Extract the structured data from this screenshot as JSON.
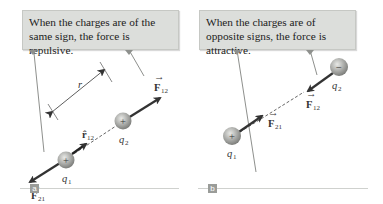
{
  "panels": {
    "a": {
      "tag": "a",
      "caption": "When the charges are of the same sign, the force is repulsive.",
      "charges": {
        "q1": {
          "label": "q",
          "sub": "1",
          "sign": "+"
        },
        "q2": {
          "label": "q",
          "sub": "2",
          "sign": "+"
        }
      },
      "labels": {
        "F12": "F",
        "F12_sub": "12",
        "F21": "F",
        "F21_sub": "21",
        "r12": "r̂",
        "r12_sub": "12",
        "r": "r"
      }
    },
    "b": {
      "tag": "b",
      "caption": "When the charges are of opposite signs, the force is attractive.",
      "charges": {
        "q1": {
          "label": "q",
          "sub": "1",
          "sign": "+"
        },
        "q2": {
          "label": "q",
          "sub": "2",
          "sign": "−"
        }
      },
      "labels": {
        "F12": "F",
        "F12_sub": "12",
        "F21": "F",
        "F21_sub": "21"
      }
    }
  },
  "colors": {
    "callout_bg": "#dcdedb",
    "arrow": "#333333",
    "charge": "#a8a9a6",
    "leader": "#8e908d"
  }
}
